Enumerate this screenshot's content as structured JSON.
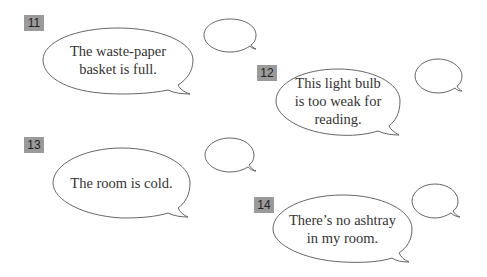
{
  "exercises": [
    {
      "number": "11",
      "statement_line1": "The waste-paper",
      "statement_line2": "basket is full.",
      "answer": ""
    },
    {
      "number": "12",
      "statement_line1": "This light bulb",
      "statement_line2": "is too weak for",
      "statement_line3": "reading.",
      "answer": ""
    },
    {
      "number": "13",
      "statement_line1": "The room is cold.",
      "answer": ""
    },
    {
      "number": "14",
      "statement_line1": "There’s no ashtray",
      "statement_line2": "in my room.",
      "answer": ""
    }
  ],
  "colors": {
    "badge_bg": "#9a9a9a",
    "bubble_stroke": "#555555",
    "text": "#333333"
  }
}
